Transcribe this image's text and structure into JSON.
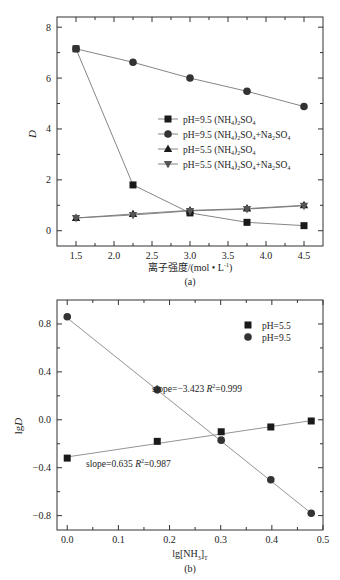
{
  "chart_data": [
    {
      "id": "a",
      "type": "line",
      "panel_label": "(a)",
      "title": "",
      "xlabel": "离子强度/(mol·L⁻¹)",
      "xlabel_main": "离子强度/(mol • L",
      "xlabel_sup": "-1",
      "xlabel_end": ")",
      "ylabel": "D",
      "xlim": [
        1.25,
        4.75
      ],
      "ylim": [
        -0.6,
        8.4
      ],
      "xticks": [
        1.5,
        2.0,
        2.5,
        3.0,
        3.5,
        4.0,
        4.5
      ],
      "xtick_labels": [
        "1.5",
        "2.0",
        "2.5",
        "3.0",
        "3.5",
        "4.0",
        "4.5"
      ],
      "yticks": [
        0,
        2,
        4,
        6,
        8
      ],
      "ytick_labels": [
        "0",
        "2",
        "4",
        "6",
        "8"
      ],
      "grid": false,
      "legend_position": "center-right",
      "x": [
        1.5,
        2.25,
        3.0,
        3.75,
        4.5
      ],
      "series": [
        {
          "name": "pH=9.5 (NH4)2SO4",
          "label_main": "pH=9.5 (NH",
          "label_sub1": "4",
          "label_mid": ")",
          "label_sub2": "2",
          "label_end": "SO",
          "label_sub3": "4",
          "label_tail": "",
          "marker": "square",
          "values": [
            7.15,
            1.8,
            0.7,
            0.33,
            0.2
          ]
        },
        {
          "name": "pH=9.5 (NH4)2SO4+Na2SO4",
          "label_main": "pH=9.5 (NH",
          "label_sub1": "4",
          "label_mid": ")",
          "label_sub2": "2",
          "label_end": "SO",
          "label_sub3": "4",
          "label_tail": "+Na₂SO₄",
          "marker": "circle",
          "values": [
            7.15,
            6.62,
            6.0,
            5.48,
            4.88
          ]
        },
        {
          "name": "pH=5.5 (NH4)2SO4",
          "label_main": "pH=5.5 (NH",
          "label_sub1": "4",
          "label_mid": ")",
          "label_sub2": "2",
          "label_end": "SO",
          "label_sub3": "4",
          "label_tail": "",
          "marker": "triangle-up",
          "values": [
            0.5,
            0.66,
            0.8,
            0.87,
            1.0
          ]
        },
        {
          "name": "pH=5.5 (NH4)2SO4+Na2SO4",
          "label_main": "pH=5.5 (NH",
          "label_sub1": "4",
          "label_mid": ")",
          "label_sub2": "2",
          "label_end": "SO",
          "label_sub3": "4",
          "label_tail": "+Na₂SO₄",
          "marker": "triangle-down",
          "values": [
            0.5,
            0.62,
            0.78,
            0.85,
            0.98
          ]
        }
      ]
    },
    {
      "id": "b",
      "type": "scatter",
      "panel_label": "(b)",
      "title": "",
      "xlabel": "lg[NH3]T",
      "xlabel_main": "lg[NH",
      "xlabel_sub": "3",
      "xlabel_end": "]",
      "xlabel_sub2": "T",
      "ylabel": "lgD",
      "xlim": [
        -0.02,
        0.5
      ],
      "ylim": [
        -0.92,
        1.0
      ],
      "xticks": [
        0.0,
        0.1,
        0.2,
        0.3,
        0.4,
        0.5
      ],
      "xtick_labels": [
        "0.0",
        "0.1",
        "0.2",
        "0.3",
        "0.4",
        "0.5"
      ],
      "yticks": [
        -0.8,
        -0.4,
        0.0,
        0.4,
        0.8
      ],
      "ytick_labels": [
        "−0.8",
        "−0.4",
        "0.0",
        "0.4",
        "0.8"
      ],
      "grid": false,
      "legend_position": "upper-right",
      "x": [
        0.0,
        0.176,
        0.301,
        0.398,
        0.477
      ],
      "series": [
        {
          "name": "pH=5.5",
          "marker": "square",
          "values": [
            -0.32,
            -0.18,
            -0.1,
            -0.06,
            -0.01
          ],
          "fit": {
            "slope": 0.635,
            "r2": 0.987,
            "x0": 0.0,
            "y0": -0.31,
            "x1": 0.477,
            "y1": -0.007
          }
        },
        {
          "name": "pH=9.5",
          "marker": "circle",
          "values": [
            0.86,
            0.25,
            -0.17,
            -0.5,
            -0.78
          ],
          "fit": {
            "slope": -3.423,
            "r2": 0.999,
            "x0": 0.0,
            "y0": 0.85,
            "x1": 0.477,
            "y1": -0.78
          }
        }
      ],
      "annotations": [
        {
          "text_main": "slope=−3.423 ",
          "text_italic": "R",
          "text_sup": "2",
          "text_end": "=0.999"
        },
        {
          "text_main": "slope=0.635 ",
          "text_italic": "R",
          "text_sup": "2",
          "text_end": "=0.987"
        }
      ]
    }
  ],
  "figure": {
    "caption": ""
  }
}
